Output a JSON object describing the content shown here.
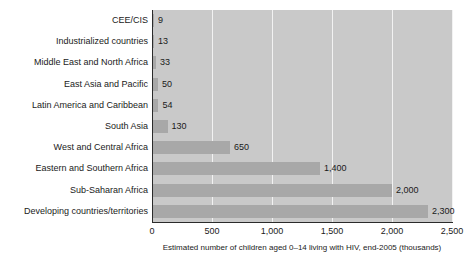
{
  "chart_data": {
    "type": "bar",
    "orientation": "horizontal",
    "title": "",
    "xlabel": "Estimated number of children aged 0–14 living with HIV, end-2005 (thousands)",
    "ylabel": "",
    "xlim": [
      0,
      2500
    ],
    "xticks": [
      0,
      500,
      1000,
      1500,
      2000,
      2500
    ],
    "xtick_labels": [
      "0",
      "500",
      "1,000",
      "1,500",
      "2,000",
      "2,500"
    ],
    "grid": "vertical-white",
    "legend": "none",
    "categories": [
      "CEE/CIS",
      "Industrialized countries",
      "Middle East and North Africa",
      "East Asia and Pacific",
      "Latin America and Caribbean",
      "South Asia",
      "West and Central Africa",
      "Eastern and Southern Africa",
      "Sub-Saharan Africa",
      "Developing countries/territories"
    ],
    "values": [
      9,
      13,
      33,
      50,
      54,
      130,
      650,
      1400,
      2000,
      2300
    ],
    "value_labels": [
      "9",
      "13",
      "33",
      "50",
      "54",
      "130",
      "650",
      "1,400",
      "2,000",
      "2,300"
    ],
    "colors": {
      "bar": "#a8a8a8",
      "plot_background": "#c9c9c9",
      "gridline": "#f2f2f2",
      "axis": "#2b2b2b",
      "text": "#1a1a1a",
      "page_background": "#ffffff"
    }
  }
}
